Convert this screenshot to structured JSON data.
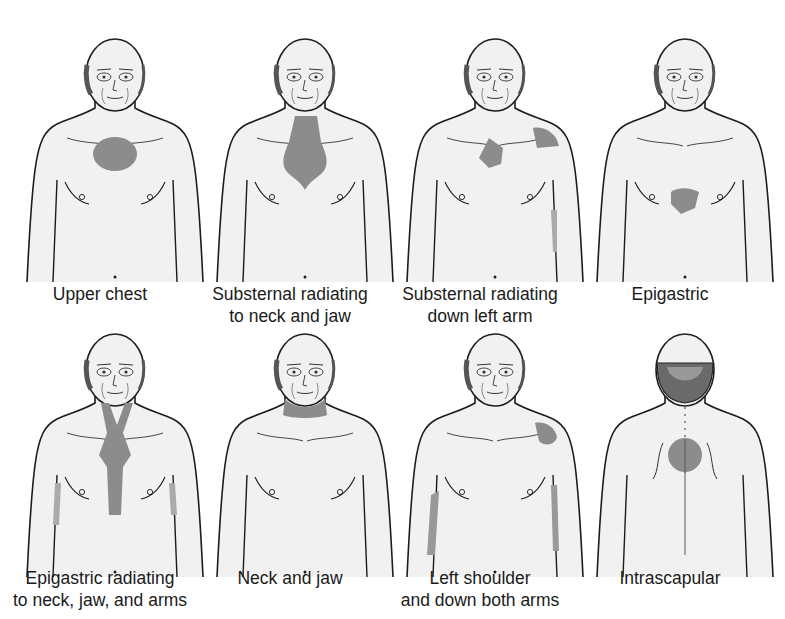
{
  "figure": {
    "title": "",
    "colors": {
      "skin": "#f1f1f1",
      "outline": "#1c1c1c",
      "pain_area": "#8c8c8c",
      "hair": "#555555",
      "background": "#ffffff"
    },
    "panels": [
      {
        "id": "upper-chest",
        "label_line1": "Upper chest",
        "label_line2": "",
        "view": "front",
        "pain_region": "central chest (round)"
      },
      {
        "id": "substernal-neck-jaw",
        "label_line1": "Substernal radiating",
        "label_line2": "to neck and jaw",
        "view": "front",
        "pain_region": "sternum up to neck"
      },
      {
        "id": "substernal-left-arm",
        "label_line1": "Substernal radiating",
        "label_line2": "down left arm",
        "view": "front",
        "pain_region": "left chest, left shoulder, left arm"
      },
      {
        "id": "epigastric",
        "label_line1": "Epigastric",
        "label_line2": "",
        "view": "front",
        "pain_region": "upper abdomen"
      },
      {
        "id": "epigastric-neck-jaw-arms",
        "label_line1": "Epigastric radiating",
        "label_line2": "to neck, jaw, and arms",
        "view": "front",
        "pain_region": "epigastrium to neck, both arms"
      },
      {
        "id": "neck-jaw",
        "label_line1": "Neck and jaw",
        "label_line2": "",
        "view": "front",
        "pain_region": "lower neck / jaw"
      },
      {
        "id": "left-shoulder-both-arms",
        "label_line1": "Left shoulder",
        "label_line2": "and down both arms",
        "view": "front",
        "pain_region": "left shoulder, both inner arms"
      },
      {
        "id": "intrascapular",
        "label_line1": "Intrascapular",
        "label_line2": "",
        "view": "back",
        "pain_region": "between shoulder blades"
      }
    ]
  }
}
